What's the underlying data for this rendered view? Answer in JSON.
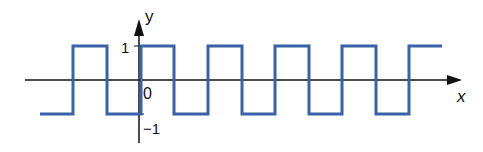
{
  "diagram": {
    "axes": {
      "x_label": "x",
      "y_label": "y",
      "origin_label": "0",
      "y_tick_high": "1",
      "y_tick_low": "−1"
    },
    "wave": {
      "color": "#3a62a8",
      "amplitude_high": 1,
      "amplitude_low": -1,
      "rising_edges_px": [
        73,
        141,
        208,
        275,
        342,
        409
      ],
      "falling_edges_px": [
        107,
        174,
        242,
        309,
        376
      ]
    },
    "axis_color": "#111111"
  }
}
